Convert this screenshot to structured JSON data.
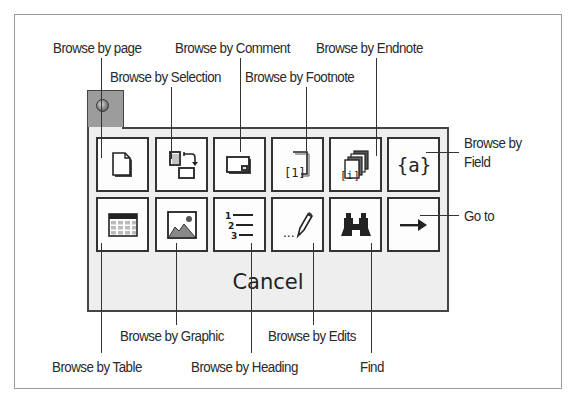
{
  "toolbar": {
    "tab_icon": "circle-knob-icon",
    "cancel_label": "Cancel",
    "buttons": [
      {
        "name": "browse-by-page",
        "icon": "page-icon",
        "row": 1,
        "col": 1
      },
      {
        "name": "browse-by-selection",
        "icon": "selection-icon",
        "row": 1,
        "col": 2
      },
      {
        "name": "browse-by-comment",
        "icon": "comment-icon",
        "row": 1,
        "col": 3
      },
      {
        "name": "browse-by-footnote",
        "icon": "footnote-icon",
        "row": 1,
        "col": 4
      },
      {
        "name": "browse-by-endnote",
        "icon": "endnote-icon",
        "row": 1,
        "col": 5
      },
      {
        "name": "browse-by-field",
        "icon": "field-icon",
        "row": 1,
        "col": 6
      },
      {
        "name": "browse-by-table",
        "icon": "table-icon",
        "row": 2,
        "col": 1
      },
      {
        "name": "browse-by-graphic",
        "icon": "graphic-icon",
        "row": 2,
        "col": 2
      },
      {
        "name": "browse-by-heading",
        "icon": "heading-icon",
        "row": 2,
        "col": 3
      },
      {
        "name": "browse-by-edits",
        "icon": "edits-icon",
        "row": 2,
        "col": 4
      },
      {
        "name": "find",
        "icon": "binoculars-icon",
        "row": 2,
        "col": 5
      },
      {
        "name": "go-to",
        "icon": "arrow-right-icon",
        "row": 2,
        "col": 6
      }
    ],
    "footnote_glyph": "[1]",
    "endnote_glyph": "[i]",
    "field_glyph": "{a}",
    "heading_numbers": [
      "1",
      "2",
      "3"
    ],
    "edits_glyph": "..."
  },
  "callouts": {
    "browse_by_page": "Browse by page",
    "browse_by_selection": "Browse by Selection",
    "browse_by_comment": "Browse by Comment",
    "browse_by_footnote": "Browse by Footnote",
    "browse_by_endnote": "Browse by Endnote",
    "browse_by_field_line1": "Browse by",
    "browse_by_field_line2": "Field",
    "go_to": "Go to",
    "browse_by_graphic": "Browse by Graphic",
    "browse_by_edits": "Browse by Edits",
    "browse_by_table": "Browse by Table",
    "browse_by_heading": "Browse by Heading",
    "find": "Find"
  }
}
